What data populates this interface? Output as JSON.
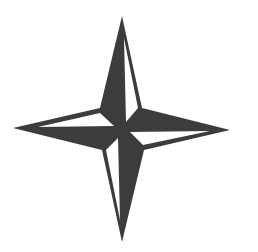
{
  "image": {
    "subject": "four-pointed compass star",
    "colors": {
      "background": "#ffffff",
      "fill": "#3c3c3c",
      "light": "#ffffff"
    }
  }
}
